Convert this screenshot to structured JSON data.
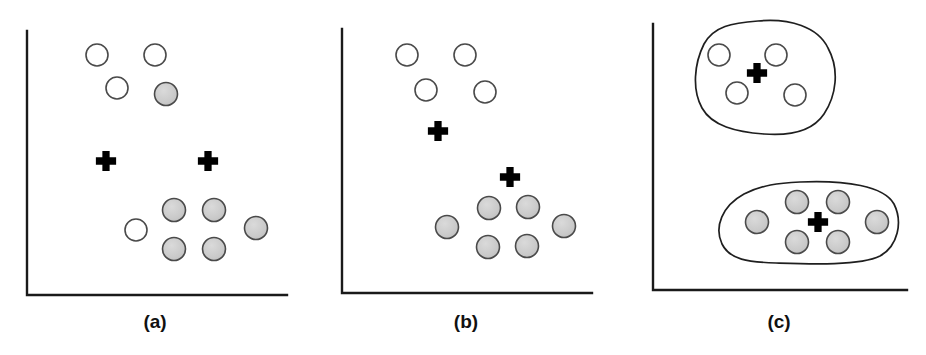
{
  "figure": {
    "title": "",
    "background_color": "#ffffff",
    "width": 926,
    "height": 355,
    "colors": {
      "axis": "#1a1a1a",
      "open_circle_fill": "#ffffff",
      "open_circle_stroke": "#4a4a4a",
      "shaded_circle_fill": "#c9c9c9",
      "shaded_circle_stroke": "#4a4a4a",
      "plus_marker": "#000000",
      "blob_outline": "#1f1f1f",
      "caption_text": "#111111"
    },
    "legend_semantics": {
      "open_circle": "unassigned / class-one data point",
      "shaded_circle": "assigned / class-two data point",
      "plus": "cluster centroid",
      "closed_curve": "final cluster boundary"
    }
  },
  "chart_data": {
    "type": "scatter",
    "title": "",
    "xlabel": "",
    "ylabel": "",
    "xlim": [
      0,
      100
    ],
    "ylim": [
      0,
      100
    ],
    "grid": false,
    "legend_position": "none",
    "panels": [
      {
        "id": "a",
        "caption": "(a)",
        "caption_x": 155,
        "caption_y": 328,
        "axes": {
          "origin_x": 27,
          "origin_y": 295,
          "top_y": 31,
          "right_x": 287
        },
        "series": [
          {
            "name": "open-circles",
            "marker": "open-circle",
            "radius": 11,
            "points": [
              {
                "x": 97,
                "y": 55
              },
              {
                "x": 155,
                "y": 55
              },
              {
                "x": 117,
                "y": 88
              },
              {
                "x": 136,
                "y": 230
              }
            ]
          },
          {
            "name": "shaded-circles",
            "marker": "shaded-circle",
            "radius": 11.5,
            "points": [
              {
                "x": 166,
                "y": 94
              },
              {
                "x": 174,
                "y": 210
              },
              {
                "x": 214,
                "y": 210
              },
              {
                "x": 256,
                "y": 228
              },
              {
                "x": 174,
                "y": 249
              },
              {
                "x": 214,
                "y": 249
              }
            ]
          },
          {
            "name": "centroids",
            "marker": "plus",
            "size": 11,
            "points": [
              {
                "x": 106,
                "y": 161
              },
              {
                "x": 208,
                "y": 161
              }
            ]
          }
        ],
        "blobs": []
      },
      {
        "id": "b",
        "caption": "(b)",
        "caption_x": 466,
        "caption_y": 328,
        "axes": {
          "origin_x": 342,
          "origin_y": 293,
          "top_y": 29,
          "right_x": 592
        },
        "series": [
          {
            "name": "open-circles",
            "marker": "open-circle",
            "radius": 11,
            "points": [
              {
                "x": 407,
                "y": 55
              },
              {
                "x": 465,
                "y": 55
              },
              {
                "x": 426,
                "y": 90
              },
              {
                "x": 485,
                "y": 92
              }
            ]
          },
          {
            "name": "shaded-circles",
            "marker": "shaded-circle",
            "radius": 11.5,
            "points": [
              {
                "x": 447,
                "y": 227
              },
              {
                "x": 489,
                "y": 208
              },
              {
                "x": 528,
                "y": 207
              },
              {
                "x": 564,
                "y": 226
              },
              {
                "x": 488,
                "y": 247
              },
              {
                "x": 527,
                "y": 246
              }
            ]
          },
          {
            "name": "centroids",
            "marker": "plus",
            "size": 11,
            "points": [
              {
                "x": 438,
                "y": 131
              },
              {
                "x": 510,
                "y": 177
              }
            ]
          }
        ],
        "blobs": []
      },
      {
        "id": "c",
        "caption": "(c)",
        "caption_x": 779,
        "caption_y": 328,
        "axes": {
          "origin_x": 653,
          "origin_y": 290,
          "top_y": 24,
          "right_x": 907
        },
        "series": [
          {
            "name": "open-circles",
            "marker": "open-circle",
            "radius": 11,
            "points": [
              {
                "x": 719,
                "y": 55
              },
              {
                "x": 776,
                "y": 55
              },
              {
                "x": 737,
                "y": 93
              },
              {
                "x": 795,
                "y": 95
              }
            ]
          },
          {
            "name": "shaded-circles",
            "marker": "shaded-circle",
            "radius": 11.5,
            "points": [
              {
                "x": 757,
                "y": 222
              },
              {
                "x": 797,
                "y": 202
              },
              {
                "x": 838,
                "y": 202
              },
              {
                "x": 877,
                "y": 222
              },
              {
                "x": 797,
                "y": 242
              },
              {
                "x": 838,
                "y": 242
              }
            ]
          },
          {
            "name": "centroids",
            "marker": "plus",
            "size": 11,
            "points": [
              {
                "x": 757,
                "y": 73
              },
              {
                "x": 818,
                "y": 222
              }
            ]
          }
        ],
        "blobs": [
          {
            "name": "cluster-boundary-top",
            "path": "M 758 21 C 790 18 818 27 828 48 C 840 70 836 96 824 114 C 812 132 790 136 764 134 C 736 132 712 126 702 108 C 692 90 694 64 704 44 C 714 26 732 23 758 21 Z"
          },
          {
            "name": "cluster-boundary-bottom",
            "path": "M 800 182 C 846 180 884 186 894 204 C 903 222 898 246 880 256 C 860 266 808 264 776 263 C 748 262 730 260 722 244 C 714 227 722 206 744 194 C 762 185 778 183 800 182 Z"
          }
        ]
      }
    ]
  }
}
